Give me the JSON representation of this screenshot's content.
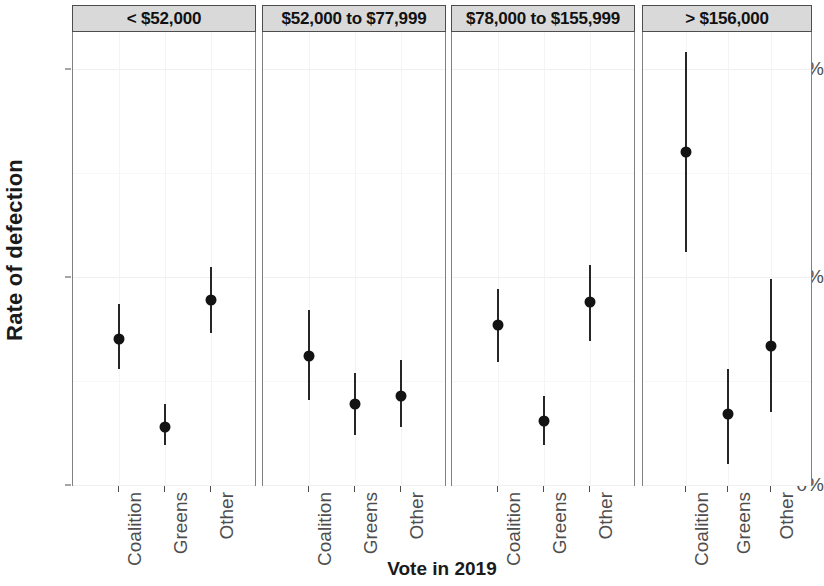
{
  "chart_data": {
    "type": "scatter",
    "title": "",
    "xlabel": "Vote in 2019",
    "ylabel": "Rate of defection",
    "ylim": [
      0,
      22.5
    ],
    "y_ticks": [
      {
        "value": 0,
        "label": "0%"
      },
      {
        "value": 10,
        "label": "10%"
      },
      {
        "value": 20,
        "label": "20%"
      }
    ],
    "y_minor_ticks": [
      5,
      15
    ],
    "grid": true,
    "legend": "none",
    "facet_variable": "Household income",
    "categories": [
      "Coalition",
      "Greens",
      "Other"
    ],
    "panels": [
      {
        "label": "< $52,000",
        "points": [
          {
            "category": "Coalition",
            "value": 7.0,
            "low": 5.6,
            "high": 8.7
          },
          {
            "category": "Greens",
            "value": 2.8,
            "low": 1.9,
            "high": 3.9
          },
          {
            "category": "Other",
            "value": 8.9,
            "low": 7.3,
            "high": 10.5
          }
        ]
      },
      {
        "label": "$52,000 to $77,999",
        "points": [
          {
            "category": "Coalition",
            "value": 6.2,
            "low": 4.1,
            "high": 8.4
          },
          {
            "category": "Greens",
            "value": 3.9,
            "low": 2.4,
            "high": 5.4
          },
          {
            "category": "Other",
            "value": 4.3,
            "low": 2.8,
            "high": 6.0
          }
        ]
      },
      {
        "label": "$78,000 to $155,999",
        "points": [
          {
            "category": "Coalition",
            "value": 7.7,
            "low": 5.9,
            "high": 9.4
          },
          {
            "category": "Greens",
            "value": 3.1,
            "low": 1.9,
            "high": 4.3
          },
          {
            "category": "Other",
            "value": 8.8,
            "low": 6.9,
            "high": 10.6
          }
        ]
      },
      {
        "label": "> $156,000",
        "points": [
          {
            "category": "Coalition",
            "value": 16.0,
            "low": 11.2,
            "high": 20.8
          },
          {
            "category": "Greens",
            "value": 3.4,
            "low": 1.0,
            "high": 5.6
          },
          {
            "category": "Other",
            "value": 6.7,
            "low": 3.5,
            "high": 9.9
          }
        ]
      }
    ]
  },
  "axis": {
    "y_title": "Rate of defection",
    "x_title": "Vote in 2019"
  },
  "colors": {
    "point": "#131313",
    "errorbar": "#262626",
    "strip_background": "#d9d9d9",
    "panel_border": "#808080",
    "tick_text": "#4d4d4d",
    "grid_major": "#f0f0f0"
  }
}
